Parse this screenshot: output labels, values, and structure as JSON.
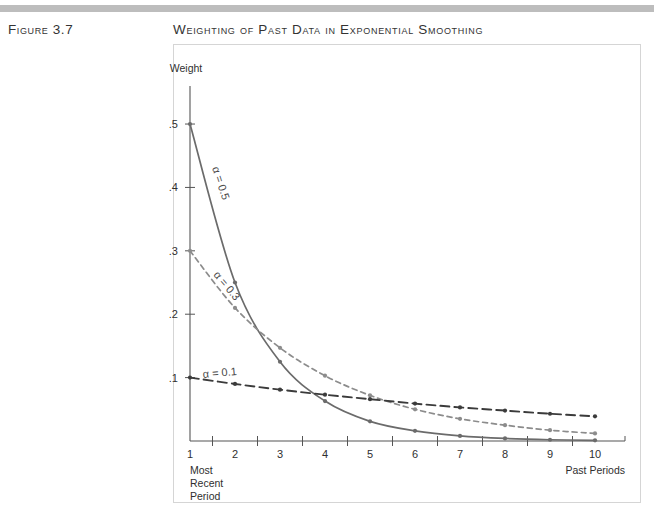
{
  "figure": {
    "number_label": "Figure 3.7",
    "title": "Weighting of Past Data in Exponential Smoothing"
  },
  "colors": {
    "rule": "#bdbdbd",
    "frame": "#d5d5d5",
    "axis": "#555555",
    "alpha_05": "#6b6b6b",
    "alpha_03": "#8c8c8c",
    "alpha_01": "#3b3b3b"
  },
  "axes": {
    "y_title": "Weight",
    "y_ticks": [
      ".1",
      ".2",
      ".3",
      ".4",
      ".5"
    ],
    "x_ticks": [
      "1",
      "2",
      "3",
      "4",
      "5",
      "6",
      "7",
      "8",
      "9",
      "10"
    ],
    "x_caption_right": "Past Periods",
    "x_caption_left_line1": "Most",
    "x_caption_left_line2": "Recent",
    "x_caption_left_line3": "Period"
  },
  "series_labels": {
    "alpha_05": "α = 0.5",
    "alpha_03": "α = 0.3",
    "alpha_01": "α = 0.1"
  },
  "chart_data": {
    "type": "line",
    "title": "Weighting of Past Data in Exponential Smoothing",
    "xlabel": "Past Periods",
    "ylabel": "Weight",
    "x": [
      1,
      2,
      3,
      4,
      5,
      6,
      7,
      8,
      9,
      10
    ],
    "xlim": [
      1,
      10
    ],
    "ylim": [
      0,
      0.56
    ],
    "ytick_values": [
      0.1,
      0.2,
      0.3,
      0.4,
      0.5
    ],
    "grid": false,
    "legend": "inline-annotation",
    "series": [
      {
        "name": "α = 0.5",
        "alpha": 0.5,
        "style": "solid",
        "color": "#6b6b6b",
        "values": [
          0.5,
          0.25,
          0.125,
          0.063,
          0.031,
          0.016,
          0.008,
          0.004,
          0.002,
          0.001
        ]
      },
      {
        "name": "α = 0.3",
        "alpha": 0.3,
        "style": "dashed",
        "color": "#8c8c8c",
        "values": [
          0.3,
          0.21,
          0.147,
          0.103,
          0.072,
          0.05,
          0.035,
          0.025,
          0.017,
          0.012
        ]
      },
      {
        "name": "α = 0.1",
        "alpha": 0.1,
        "style": "long-dashed",
        "color": "#3b3b3b",
        "values": [
          0.1,
          0.09,
          0.081,
          0.073,
          0.066,
          0.059,
          0.053,
          0.048,
          0.043,
          0.039
        ]
      }
    ]
  }
}
